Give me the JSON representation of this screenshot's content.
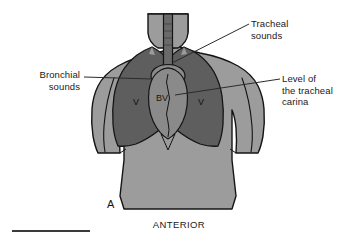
{
  "figure": {
    "panel_id": "A",
    "orientation_label": "ANTERIOR",
    "view": "anterior thoracic auscultation map"
  },
  "annotations": {
    "tracheal_sounds": "Tracheal\nsounds",
    "bronchial_sounds": "Bronchial\nsounds",
    "level_of_tracheal_carina": "Level of\nthe tracheal\ncarina"
  },
  "organ_tags": {
    "left_lung_vesicular": "V",
    "right_lung_vesicular": "V",
    "bronchial": "B",
    "bronchovesicular": "BV"
  },
  "colors": {
    "background": "#ffffff",
    "body_fill": "#9c9c9c",
    "lung_fill": "#5e5e5e",
    "mediastinum_fill": "#8a8a8a",
    "trachea_fill": "#6a6a6a",
    "outline": "#141414",
    "leader_line": "#2b2b2b",
    "scale_bar": "#3a3a3a",
    "text": "#1a1a1a"
  },
  "scale_bar": {
    "x_start": 12,
    "x_end": 90,
    "y": 231
  }
}
